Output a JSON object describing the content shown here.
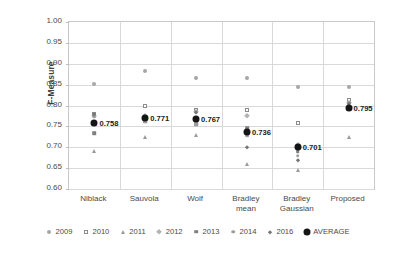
{
  "chart_data": {
    "type": "scatter",
    "title": "",
    "xlabel": "",
    "ylabel": "F-Measure",
    "ylim": [
      0.6,
      1.0
    ],
    "ytick_step": 0.05,
    "yticks": [
      "1.00",
      "0.95",
      "0.90",
      "0.85",
      "0.80",
      "0.75",
      "0.70",
      "0.65",
      "0.60"
    ],
    "grid": true,
    "legend_position": "bottom",
    "categories": [
      "Niblack",
      "Sauvola",
      "Wolf",
      "Bradley mean",
      "Bradley Gaussian",
      "Proposed"
    ],
    "category_labels": [
      [
        "Niblack"
      ],
      [
        "Sauvola"
      ],
      [
        "Wolf"
      ],
      [
        "Bradley",
        "mean"
      ],
      [
        "Bradley",
        "Gaussian"
      ],
      [
        "Proposed"
      ]
    ],
    "series": [
      {
        "name": "2009",
        "marker": "circle-gray",
        "values": [
          0.852,
          0.883,
          0.867,
          0.866,
          0.845,
          0.845
        ]
      },
      {
        "name": "2010",
        "marker": "square-open",
        "values": [
          0.78,
          0.8,
          0.79,
          0.79,
          0.758,
          0.812
        ]
      },
      {
        "name": "2011",
        "marker": "triangle",
        "values": [
          0.69,
          0.725,
          0.73,
          0.66,
          0.645,
          0.725
        ]
      },
      {
        "name": "2012",
        "marker": "diamond",
        "values": [
          0.775,
          0.775,
          0.785,
          0.775,
          0.705,
          0.805
        ]
      },
      {
        "name": "2013",
        "marker": "square-filled",
        "values": [
          0.733,
          0.762,
          0.755,
          0.745,
          0.69,
          0.8
        ]
      },
      {
        "name": "2014",
        "marker": "circle-small-gray",
        "values": [
          0.775,
          0.762,
          0.755,
          0.728,
          0.68,
          0.8
        ]
      },
      {
        "name": "2016",
        "marker": "diamond-small",
        "values": [
          0.78,
          0.775,
          0.785,
          0.7,
          0.67,
          0.805
        ]
      },
      {
        "name": "AVERAGE",
        "marker": "circle-black-large",
        "values": [
          0.758,
          0.771,
          0.767,
          0.736,
          0.701,
          0.795
        ]
      }
    ],
    "average_labels": [
      "0.758",
      "0.771",
      "0.767",
      "0.736",
      "0.701",
      "0.795"
    ],
    "colors": {
      "average": "#151515",
      "gridline": "#d9d9d9",
      "border": "#c9c9c9",
      "text": "#4a4a4a"
    }
  },
  "legend": {
    "entries": [
      {
        "label": "2009"
      },
      {
        "label": "2010"
      },
      {
        "label": "2011"
      },
      {
        "label": "2012"
      },
      {
        "label": "2013"
      },
      {
        "label": "2014"
      },
      {
        "label": "2016"
      },
      {
        "label": "AVERAGE"
      }
    ]
  }
}
